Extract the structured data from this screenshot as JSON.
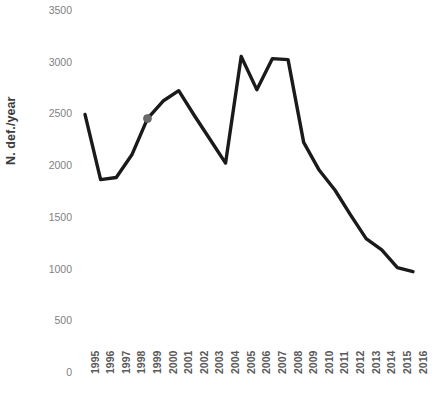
{
  "chart_data": {
    "type": "line",
    "title": "",
    "subtitle": "",
    "xlabel": "",
    "ylabel": "N. def./year",
    "grid": false,
    "legend": null,
    "xlim": [
      1995,
      2016
    ],
    "ylim": [
      0,
      3500
    ],
    "y_ticks": [
      3500,
      3000,
      2500,
      2000,
      1500,
      1000,
      500,
      0
    ],
    "y_tick_labels": [
      "3500",
      "3000",
      "2500",
      "2000",
      "1500",
      "1000",
      "500",
      "0"
    ],
    "x_ticks": [
      1995,
      1996,
      1997,
      1998,
      1999,
      2000,
      2001,
      2002,
      2003,
      2004,
      2005,
      2006,
      2007,
      2008,
      2009,
      2010,
      2011,
      2012,
      2013,
      2014,
      2015,
      2016
    ],
    "x_tick_labels": [
      "1995",
      "1996",
      "1997",
      "1998",
      "1999",
      "2000",
      "2001",
      "2002",
      "2003",
      "2004",
      "2005",
      "2006",
      "2007",
      "2008",
      "2009",
      "2010",
      "2011",
      "2012",
      "2013",
      "2014",
      "2015",
      "2016"
    ],
    "categories": [
      "1995",
      "1996",
      "1997",
      "1998",
      "1999",
      "2000",
      "2001",
      "2002",
      "2003",
      "2004",
      "2005",
      "2006",
      "2007",
      "2008",
      "2009",
      "2010",
      "2011",
      "2012",
      "2013",
      "2014",
      "2015",
      "2016"
    ],
    "values": [
      2490,
      1860,
      1880,
      2100,
      2450,
      2620,
      2720,
      2480,
      2250,
      2020,
      3050,
      2730,
      3030,
      3020,
      2220,
      1950,
      1760,
      1520,
      1290,
      1180,
      1010,
      970
    ],
    "series": [
      {
        "name": "N. def./year",
        "values": [
          2490,
          1860,
          1880,
          2100,
          2450,
          2620,
          2720,
          2480,
          2250,
          2020,
          3050,
          2730,
          3030,
          3020,
          2220,
          1950,
          1760,
          1520,
          1290,
          1180,
          1010,
          970
        ],
        "color": "#1a1a1a",
        "line_width": 3.4
      }
    ],
    "markers": [
      {
        "x": "1999",
        "y": 2450,
        "color": "#6b6b6b",
        "radius": 4
      }
    ],
    "annotations": []
  },
  "axes": {
    "y_title": "N. def./year",
    "y_tick_color": "#7f7f7f",
    "x_tick_color": "#5a5a5a"
  },
  "colors": {
    "background": "#ffffff",
    "line": "#1a1a1a",
    "marker": "#6b6b6b",
    "y_tick_text": "#7f7f7f",
    "x_tick_text": "#5a5a5a",
    "axis_title": "#3d3d3d"
  }
}
